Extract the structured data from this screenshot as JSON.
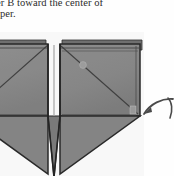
{
  "page": {
    "background_color": "#fefefe",
    "width": 174,
    "height": 176
  },
  "caption": {
    "line_1": "corner B toward the center of",
    "line_2": "the paper.",
    "text_color": "#2b2b2b",
    "clipped": "left edge of both lines is cut off by the crop"
  },
  "figure": {
    "name": "origami-folded-square-diagram",
    "paper_fill": "#8a8a8a",
    "paper_fill_shadow": "#6f6f6f",
    "paper_fill_light": "#9a9a9a",
    "outline_color": "#2a2a2a",
    "crease_color": "#3a3a3a",
    "labels": {
      "left_panel": "",
      "right_panel": "B",
      "corner_mark": "A"
    }
  },
  "edge_arrow": {
    "name": "curved-fold-arrow",
    "color": "#4a4a4a",
    "direction": "left",
    "clipped": "partially cut off at right edge"
  }
}
